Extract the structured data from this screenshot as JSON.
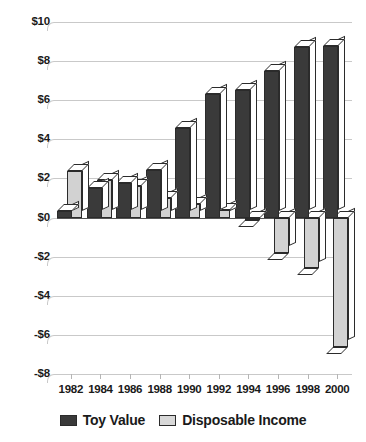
{
  "chart_data": {
    "type": "bar",
    "title": "",
    "subtitle": "",
    "xlabel": "",
    "ylabel": "",
    "categories": [
      "1982",
      "1984",
      "1986",
      "1988",
      "1990",
      "1992",
      "1994",
      "1996",
      "1998",
      "2000"
    ],
    "series": [
      {
        "name": "Toy Value",
        "color": "#3a3a3a",
        "values": [
          0.35,
          1.5,
          1.75,
          2.45,
          4.6,
          6.3,
          6.5,
          7.5,
          8.7,
          8.75
        ]
      },
      {
        "name": "Disposable Income",
        "color": "#d2d2d2",
        "values": [
          2.4,
          1.9,
          1.6,
          1.0,
          0.7,
          0.4,
          -0.15,
          -1.8,
          -2.6,
          -6.6
        ]
      }
    ],
    "ylim": [
      -8,
      10
    ],
    "ytick_values": [
      10,
      8,
      6,
      4,
      2,
      0,
      -2,
      -4,
      -6,
      -8
    ],
    "ytick_labels": [
      "$10",
      "$8",
      "$6",
      "$4",
      "$2",
      "$0",
      "-$2",
      "-$4",
      "-$6",
      "-$8"
    ],
    "grid": true,
    "grid_axis": "y",
    "legend_position": "bottom",
    "bar_style": "3d"
  },
  "legend": {
    "items": [
      {
        "label": "Toy Value",
        "swatch": "toy"
      },
      {
        "label": "Disposable Income",
        "swatch": "inc"
      }
    ]
  },
  "colors": {
    "toy_value": "#3a3a3a",
    "disposable_income": "#d2d2d2",
    "gridline": "#c9c9c9",
    "axis": "#555555",
    "text": "#1a1a1a",
    "background": "#ffffff"
  }
}
